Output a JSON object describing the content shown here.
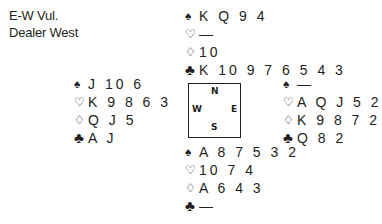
{
  "info": {
    "vulnerability": "E-W Vul.",
    "dealer": "Dealer West"
  },
  "suit_symbols": {
    "spades": "♠",
    "hearts": "♡",
    "diamonds": "♢",
    "clubs": "♣"
  },
  "compass": {
    "north": "N",
    "south": "S",
    "west": "W",
    "east": "E"
  },
  "hands": {
    "north": {
      "spades": "K Q 9 4",
      "hearts": "—",
      "diamonds": "10",
      "clubs": "K 10 9 7 6 5 4 3"
    },
    "west": {
      "spades": "J 10 6",
      "hearts": "K 9 8 6 3",
      "diamonds": "Q J 5",
      "clubs": "A J"
    },
    "east": {
      "spades": "—",
      "hearts": "A Q J 5 2",
      "diamonds": "K 9 8 7 2",
      "clubs": "Q 8 2"
    },
    "south": {
      "spades": "A 8 7 5 3 2",
      "hearts": "10 7 4",
      "diamonds": "A 6 4 3",
      "clubs": "—"
    }
  }
}
